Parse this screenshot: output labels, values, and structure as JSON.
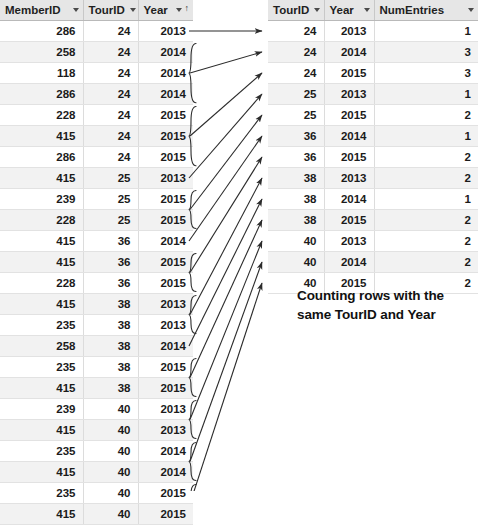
{
  "source_table": {
    "name": "member-tour-entries",
    "columns": [
      {
        "key": "member_id",
        "label": "MemberID",
        "sort": "none",
        "dropdown": true
      },
      {
        "key": "tour_id",
        "label": "TourID",
        "sort": "ascending",
        "dropdown": true
      },
      {
        "key": "year",
        "label": "Year",
        "sort": "ascending",
        "dropdown": true
      }
    ],
    "rows": [
      {
        "member_id": "286",
        "tour_id": "24",
        "year": "2013"
      },
      {
        "member_id": "258",
        "tour_id": "24",
        "year": "2014"
      },
      {
        "member_id": "118",
        "tour_id": "24",
        "year": "2014"
      },
      {
        "member_id": "286",
        "tour_id": "24",
        "year": "2014"
      },
      {
        "member_id": "228",
        "tour_id": "24",
        "year": "2015"
      },
      {
        "member_id": "415",
        "tour_id": "24",
        "year": "2015"
      },
      {
        "member_id": "286",
        "tour_id": "24",
        "year": "2015"
      },
      {
        "member_id": "415",
        "tour_id": "25",
        "year": "2013"
      },
      {
        "member_id": "239",
        "tour_id": "25",
        "year": "2015"
      },
      {
        "member_id": "228",
        "tour_id": "25",
        "year": "2015"
      },
      {
        "member_id": "415",
        "tour_id": "36",
        "year": "2014"
      },
      {
        "member_id": "415",
        "tour_id": "36",
        "year": "2015"
      },
      {
        "member_id": "228",
        "tour_id": "36",
        "year": "2015"
      },
      {
        "member_id": "415",
        "tour_id": "38",
        "year": "2013"
      },
      {
        "member_id": "235",
        "tour_id": "38",
        "year": "2013"
      },
      {
        "member_id": "258",
        "tour_id": "38",
        "year": "2014"
      },
      {
        "member_id": "235",
        "tour_id": "38",
        "year": "2015"
      },
      {
        "member_id": "415",
        "tour_id": "38",
        "year": "2015"
      },
      {
        "member_id": "239",
        "tour_id": "40",
        "year": "2013"
      },
      {
        "member_id": "415",
        "tour_id": "40",
        "year": "2013"
      },
      {
        "member_id": "235",
        "tour_id": "40",
        "year": "2014"
      },
      {
        "member_id": "415",
        "tour_id": "40",
        "year": "2014"
      },
      {
        "member_id": "235",
        "tour_id": "40",
        "year": "2015"
      },
      {
        "member_id": "415",
        "tour_id": "40",
        "year": "2015"
      }
    ]
  },
  "result_table": {
    "name": "tour-year-counts",
    "columns": [
      {
        "key": "tour_id",
        "label": "TourID",
        "sort": "none",
        "dropdown": true
      },
      {
        "key": "year",
        "label": "Year",
        "sort": "none",
        "dropdown": true
      },
      {
        "key": "num_entries",
        "label": "NumEntries",
        "sort": "none",
        "dropdown": true
      }
    ],
    "rows": [
      {
        "tour_id": "24",
        "year": "2013",
        "num_entries": "1"
      },
      {
        "tour_id": "24",
        "year": "2014",
        "num_entries": "3"
      },
      {
        "tour_id": "24",
        "year": "2015",
        "num_entries": "3"
      },
      {
        "tour_id": "25",
        "year": "2013",
        "num_entries": "1"
      },
      {
        "tour_id": "25",
        "year": "2015",
        "num_entries": "2"
      },
      {
        "tour_id": "36",
        "year": "2014",
        "num_entries": "1"
      },
      {
        "tour_id": "36",
        "year": "2015",
        "num_entries": "2"
      },
      {
        "tour_id": "38",
        "year": "2013",
        "num_entries": "2"
      },
      {
        "tour_id": "38",
        "year": "2014",
        "num_entries": "1"
      },
      {
        "tour_id": "38",
        "year": "2015",
        "num_entries": "2"
      },
      {
        "tour_id": "40",
        "year": "2013",
        "num_entries": "2"
      },
      {
        "tour_id": "40",
        "year": "2014",
        "num_entries": "2"
      },
      {
        "tour_id": "40",
        "year": "2015",
        "num_entries": "2"
      }
    ]
  },
  "caption": {
    "line1": "Counting rows with the",
    "line2": "same TourID and Year"
  },
  "annotations": {
    "icon_names": [
      "group-brace",
      "mapping-arrow",
      "arrowhead"
    ],
    "stroke_color": "#2b2b2b",
    "groups": [
      {
        "tour_id": "24",
        "year": "2013",
        "source_rows": [
          0
        ],
        "target_row": 0
      },
      {
        "tour_id": "24",
        "year": "2014",
        "source_rows": [
          1,
          2,
          3
        ],
        "target_row": 1
      },
      {
        "tour_id": "24",
        "year": "2015",
        "source_rows": [
          4,
          5,
          6
        ],
        "target_row": 2
      },
      {
        "tour_id": "25",
        "year": "2013",
        "source_rows": [
          7
        ],
        "target_row": 3
      },
      {
        "tour_id": "25",
        "year": "2015",
        "source_rows": [
          8,
          9
        ],
        "target_row": 4
      },
      {
        "tour_id": "36",
        "year": "2014",
        "source_rows": [
          10
        ],
        "target_row": 5
      },
      {
        "tour_id": "36",
        "year": "2015",
        "source_rows": [
          11,
          12
        ],
        "target_row": 6
      },
      {
        "tour_id": "38",
        "year": "2013",
        "source_rows": [
          13,
          14
        ],
        "target_row": 7
      },
      {
        "tour_id": "38",
        "year": "2014",
        "source_rows": [
          15
        ],
        "target_row": 8
      },
      {
        "tour_id": "38",
        "year": "2015",
        "source_rows": [
          16,
          17
        ],
        "target_row": 9
      },
      {
        "tour_id": "40",
        "year": "2013",
        "source_rows": [
          18,
          19
        ],
        "target_row": 10
      },
      {
        "tour_id": "40",
        "year": "2014",
        "source_rows": [
          20,
          21
        ],
        "target_row": 11
      },
      {
        "tour_id": "40",
        "year": "2015",
        "source_rows": [
          22,
          23
        ],
        "target_row": 12
      }
    ]
  },
  "theme": {
    "header_bg": "#e6e6e6",
    "row_bg": "#ffffff",
    "row_alt_bg": "#f2f2f2",
    "grid_line": "#e2e2e2",
    "text": "#1b1b1b",
    "annotation": "#2b2b2b"
  }
}
